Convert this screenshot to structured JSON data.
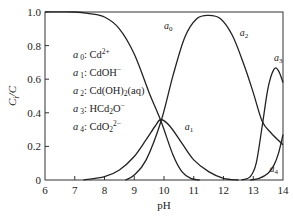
{
  "chart_data": {
    "type": "line",
    "title": "",
    "xlabel": "pH",
    "ylabel": "C_i/C",
    "xlim": [
      6,
      14
    ],
    "ylim": [
      0,
      1.0
    ],
    "x_ticks": [
      "6",
      "7",
      "8",
      "9",
      "10",
      "11",
      "12",
      "13",
      "14"
    ],
    "y_ticks": [
      "0",
      "0.2",
      "0.4",
      "0.6",
      "0.8",
      "1.0"
    ],
    "grid": false,
    "legend_position": "top-left",
    "legend": [
      {
        "symbol": "a",
        "sub": "0",
        "species": "Cd",
        "sup": "2+"
      },
      {
        "symbol": "a",
        "sub": "1",
        "species": "CdOH",
        "sup": "−"
      },
      {
        "symbol": "a",
        "sub": "2",
        "species": "Cd(OH)",
        "species_sub": "2",
        "species_tail": "(aq)"
      },
      {
        "symbol": "a",
        "sub": "3",
        "species": "HCd",
        "species_sub": "2",
        "species_tail": "O",
        "sup": "−"
      },
      {
        "symbol": "a",
        "sub": "4",
        "species": "CdO",
        "species_sub": "2",
        "sup": "2−"
      }
    ],
    "series": [
      {
        "name": "a0",
        "label": "a0",
        "x": [
          6,
          7,
          7.5,
          8,
          8.5,
          9,
          9.5,
          9.9,
          10.3,
          10.6,
          10.9,
          11.2
        ],
        "y": [
          1.0,
          1.0,
          0.99,
          0.97,
          0.9,
          0.75,
          0.52,
          0.35,
          0.15,
          0.05,
          0.01,
          0.0
        ]
      },
      {
        "name": "a1",
        "label": "a1",
        "x": [
          7.3,
          8,
          8.5,
          9,
          9.4,
          9.7,
          9.9,
          10.2,
          10.6,
          11,
          11.5,
          12,
          12.5
        ],
        "y": [
          0.0,
          0.02,
          0.06,
          0.14,
          0.24,
          0.32,
          0.36,
          0.32,
          0.22,
          0.12,
          0.05,
          0.01,
          0.0
        ]
      },
      {
        "name": "a2",
        "label": "a2",
        "x": [
          8.7,
          9,
          9.4,
          9.9,
          10.3,
          10.7,
          11.1,
          11.5,
          11.9,
          12.3,
          12.7,
          13.0,
          13.3,
          13.6,
          14
        ],
        "y": [
          0.0,
          0.03,
          0.12,
          0.35,
          0.62,
          0.85,
          0.96,
          0.98,
          0.96,
          0.86,
          0.68,
          0.52,
          0.35,
          0.28,
          0.21
        ]
      },
      {
        "name": "a3",
        "label": "a3",
        "x": [
          12.6,
          12.9,
          13.1,
          13.3,
          13.5,
          13.7,
          13.85,
          14
        ],
        "y": [
          0.0,
          0.02,
          0.1,
          0.32,
          0.55,
          0.66,
          0.65,
          0.58
        ]
      },
      {
        "name": "a4",
        "label": "a4",
        "x": [
          12.9,
          13.2,
          13.5,
          13.7,
          13.85,
          14
        ],
        "y": [
          0.0,
          0.01,
          0.04,
          0.09,
          0.16,
          0.27
        ]
      }
    ],
    "curve_labels": [
      {
        "series": "a0",
        "x": 10.0,
        "y": 0.9
      },
      {
        "series": "a1",
        "x": 10.7,
        "y": 0.3
      },
      {
        "series": "a2",
        "x": 12.55,
        "y": 0.86
      },
      {
        "series": "a3",
        "x": 13.7,
        "y": 0.71
      },
      {
        "series": "a4",
        "x": 13.55,
        "y": 0.05
      }
    ]
  }
}
